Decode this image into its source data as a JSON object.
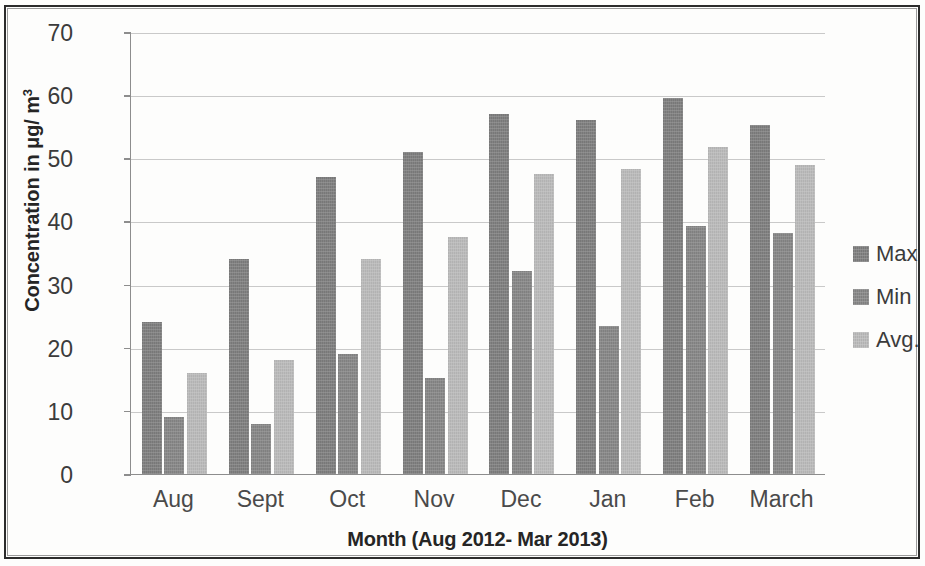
{
  "chart_data": {
    "type": "bar",
    "title": "",
    "xlabel": "Month (Aug 2012- Mar 2013)",
    "ylabel": "Concentration in μg/ m³",
    "ylabel_main": "Concentration in μg/ m",
    "ylabel_sup": "3",
    "categories": [
      "Aug",
      "Sept",
      "Oct",
      "Nov",
      "Dec",
      "Jan",
      "Feb",
      "March"
    ],
    "series": [
      {
        "name": "Max",
        "color": "#7d7d7d",
        "values": [
          24.0,
          34.0,
          47.0,
          51.0,
          57.0,
          56.0,
          59.5,
          55.3
        ]
      },
      {
        "name": "Min",
        "color": "#858585",
        "values": [
          9.0,
          8.0,
          19.0,
          15.2,
          32.2,
          23.5,
          39.2,
          38.2
        ]
      },
      {
        "name": "Avg.",
        "color": "#b9b9b9",
        "values": [
          16.0,
          18.0,
          34.0,
          37.5,
          47.5,
          48.3,
          51.8,
          49.0
        ]
      }
    ],
    "ylim": [
      0,
      70
    ],
    "yticks": [
      0,
      10,
      20,
      30,
      40,
      50,
      60,
      70
    ],
    "ytick_labels": [
      "0",
      "10",
      "20",
      "30",
      "40",
      "50",
      "60",
      "70"
    ],
    "grid": true,
    "legend_position": "right",
    "legend_entries": [
      "Max",
      "Min",
      "Avg."
    ]
  }
}
